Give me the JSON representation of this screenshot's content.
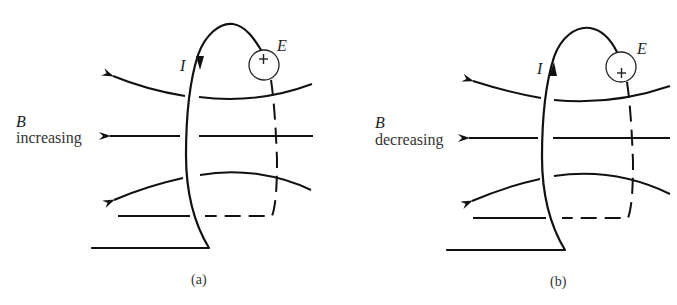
{
  "figure": {
    "panels": [
      {
        "id": "a",
        "caption": "(a)",
        "field_symbol": "B",
        "field_state": "increasing",
        "current_symbol": "I",
        "current_direction": "down",
        "emf_symbol": "E",
        "emf_polarity_mark": "+"
      },
      {
        "id": "b",
        "caption": "(b)",
        "field_symbol": "B",
        "field_state": "decreasing",
        "current_symbol": "I",
        "current_direction": "up",
        "emf_symbol": "E",
        "emf_polarity_mark": "+"
      }
    ],
    "colors": {
      "ink": "#111111",
      "background": "#ffffff"
    }
  }
}
